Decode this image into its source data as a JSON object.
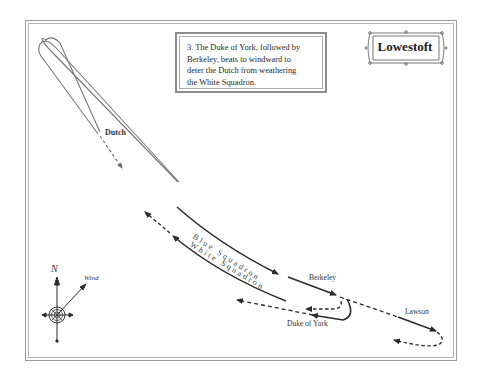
{
  "map": {
    "title": "Lowestoft",
    "caption": "3. The Duke of York, followed by Berkeley, beats to windward to deter the Dutch from weathering the White Squadron.",
    "caption_lines": [
      "3. The Duke of York, followed by",
      "Berkeley, beats to windward to",
      "deter the Dutch from weathering",
      "the White Squadron."
    ],
    "labels": {
      "dutch": "Dutch",
      "blue_squadron": "Blue Squadron",
      "white_squadron": "White Squadron",
      "berkeley": "Berkeley",
      "duke_of_york": "Duke of York",
      "lawson": "Lawson"
    },
    "compass": {
      "north_label": "N",
      "wind_label": "Wind"
    },
    "colors": {
      "line": "#2b2b2b",
      "dutch_line": "#6b6b6b",
      "frame": "#9a9a9a"
    }
  }
}
